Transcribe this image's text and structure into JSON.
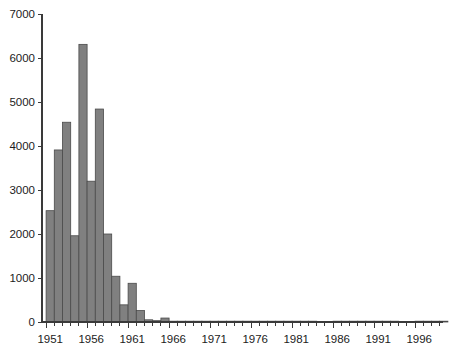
{
  "chart_data": {
    "type": "bar",
    "title": "",
    "subtitle": "",
    "xlabel": "",
    "ylabel": "",
    "xlim": [
      1950.5,
      2000.5
    ],
    "ylim": [
      0,
      7000
    ],
    "grid": false,
    "legend": null,
    "bar_color": "#808080",
    "bar_edge_color": "#4a4a4a",
    "axis_color": "#3a3a3a",
    "y_ticks": [
      0,
      1000,
      2000,
      3000,
      4000,
      5000,
      6000,
      7000
    ],
    "y_tick_labels": [
      "0",
      "1000",
      "2000",
      "3000",
      "4000",
      "5000",
      "6000",
      "7000"
    ],
    "x_tick_labels": [
      "1951",
      "1956",
      "1961",
      "1966",
      "1971",
      "1976",
      "1981",
      "1986",
      "1991",
      "1996"
    ],
    "x_labeled_years": [
      1951,
      1956,
      1961,
      1966,
      1971,
      1976,
      1981,
      1986,
      1991,
      1996
    ],
    "x_minor_tick_interval": 1,
    "categories": [
      1951,
      1952,
      1953,
      1954,
      1955,
      1956,
      1957,
      1958,
      1959,
      1960,
      1961,
      1962,
      1963,
      1964,
      1965,
      1966,
      1967,
      1968,
      1969,
      1970,
      1971,
      1972,
      1973,
      1974,
      1975,
      1976,
      1977,
      1978,
      1979,
      1980,
      1981,
      1982,
      1983,
      1984,
      1985,
      1986,
      1987,
      1988,
      1989,
      1990,
      1991,
      1992,
      1993,
      1994,
      1995,
      1996,
      1997,
      1998,
      1999,
      2000
    ],
    "values": [
      2530,
      3910,
      4540,
      1960,
      6310,
      3200,
      4840,
      2000,
      1040,
      390,
      880,
      260,
      50,
      30,
      90,
      10,
      5,
      5,
      5,
      5,
      5,
      5,
      5,
      5,
      5,
      5,
      5,
      5,
      5,
      5,
      5,
      5,
      5,
      0,
      0,
      5,
      5,
      5,
      5,
      5,
      5,
      5,
      5,
      0,
      0,
      5,
      5,
      5,
      5,
      0
    ]
  },
  "axis": {
    "y_max_label": "7000",
    "y_zero_label": "0"
  }
}
